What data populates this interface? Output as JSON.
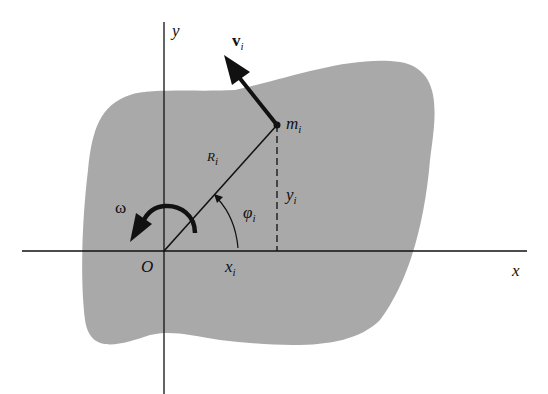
{
  "diagram": {
    "type": "rigid body rotation about fixed axis",
    "colors": {
      "body": "#a9a9a9",
      "lines": "#111111",
      "background": "#ffffff"
    },
    "labels": {
      "y_axis": "y",
      "x_axis": "x",
      "origin": "O",
      "velocity": "v",
      "velocity_sub": "i",
      "mass": "m",
      "mass_sub": "i",
      "radius": "R",
      "radius_sub": "i",
      "y_coord": "y",
      "y_coord_sub": "i",
      "x_coord": "x",
      "x_coord_sub": "i",
      "angle": "φ",
      "angle_sub": "i",
      "omega": "ω"
    }
  }
}
